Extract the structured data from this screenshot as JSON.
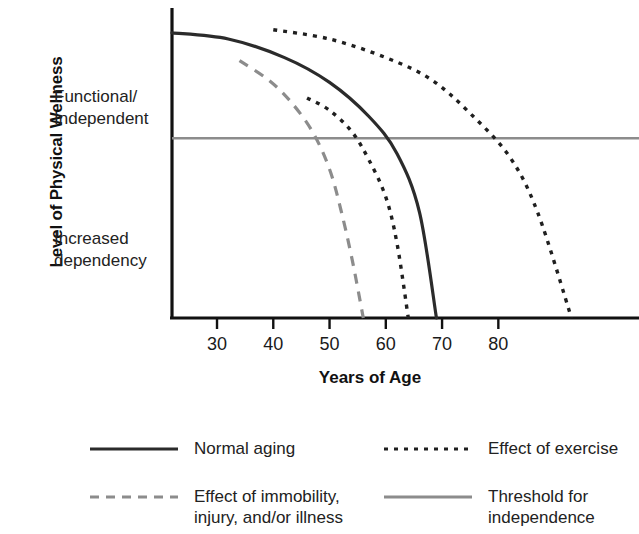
{
  "chart_data": {
    "type": "line",
    "title": "",
    "xlabel": "Years of Age",
    "ylabel": "Level of Physical Wellness",
    "xlim": [
      22,
      105
    ],
    "ylim": [
      0,
      100
    ],
    "grid": false,
    "legend_position": "bottom",
    "x_ticks": [
      "30",
      "40",
      "50",
      "60",
      "70",
      "80"
    ],
    "x_tick_values": [
      30,
      40,
      50,
      60,
      70,
      80
    ],
    "y_region_labels": [
      "Functional/\nIndependent",
      "Increased\ndependency"
    ],
    "threshold": {
      "label": "Threshold for independence",
      "value": 58,
      "color": "#8c8c8c"
    },
    "series": [
      {
        "name": "Normal aging",
        "style": "solid",
        "color": "#2b2b2b",
        "x": [
          22,
          32,
          42,
          50,
          57,
          62,
          66,
          69
        ],
        "y": [
          92,
          90,
          84,
          76,
          65,
          53,
          34,
          0
        ]
      },
      {
        "name": "Effect of exercise",
        "style": "dotted",
        "color": "#1f1f1f",
        "x": [
          40,
          50,
          60,
          68,
          75,
          82,
          87,
          93
        ],
        "y": [
          93,
          90,
          84,
          77,
          66,
          52,
          34,
          0
        ]
      },
      {
        "name": "Effect of exercise (lower path)",
        "style": "dotted",
        "color": "#1f1f1f",
        "x": [
          46,
          50,
          54,
          57,
          60,
          62,
          64
        ],
        "y": [
          71,
          67,
          60,
          51,
          39,
          24,
          0
        ]
      },
      {
        "name": "Effect of immobility, injury, and/or illness",
        "style": "dashed",
        "color": "#8c8c8c",
        "x": [
          34,
          39,
          43,
          47,
          50,
          52,
          54,
          56
        ],
        "y": [
          83,
          77,
          70,
          60,
          48,
          35,
          19,
          0
        ]
      }
    ]
  },
  "axes": {
    "y_title": "Level of Physical Wellness",
    "x_title": "Years of Age",
    "y_region_upper_line1": "Functional/",
    "y_region_upper_line2": "Independent",
    "y_region_lower_line1": "Increased",
    "y_region_lower_line2": "dependency",
    "ticks": [
      {
        "label": "30"
      },
      {
        "label": "40"
      },
      {
        "label": "50"
      },
      {
        "label": "60"
      },
      {
        "label": "70"
      },
      {
        "label": "80"
      }
    ]
  },
  "legend": {
    "items": [
      {
        "label": "Normal aging",
        "style": "solid",
        "color": "#2b2b2b"
      },
      {
        "label": "Effect of exercise",
        "style": "dotted",
        "color": "#1f1f1f"
      },
      {
        "label": "Effect of immobility,\ninjury, and/or illness",
        "style": "dashed",
        "color": "#8c8c8c"
      },
      {
        "label": "Threshold for\nindependence",
        "style": "solid",
        "color": "#8c8c8c"
      }
    ]
  },
  "colors": {
    "axis": "#111111",
    "curve_dark": "#2b2b2b",
    "curve_grey": "#8c8c8c",
    "text": "#1a1a1a",
    "background": "#ffffff"
  }
}
